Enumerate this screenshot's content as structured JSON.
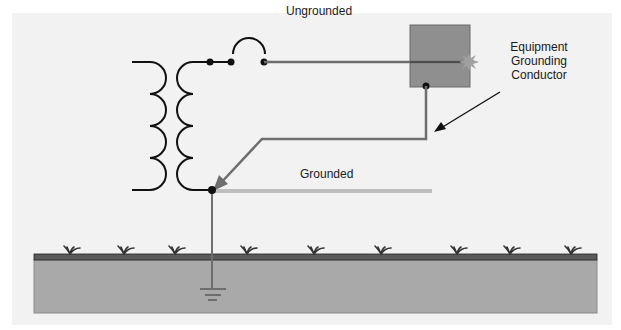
{
  "diagram": {
    "labels": {
      "ungrounded": "Ungrounded",
      "grounded": "Grounded",
      "egc_line1": "Equipment",
      "egc_line2": "Grounding",
      "egc_line3": "Conductor"
    },
    "components": [
      {
        "name": "transformer",
        "icon": "transformer-coils"
      },
      {
        "name": "overcurrent-device",
        "icon": "breaker-arc"
      },
      {
        "name": "equipment-enclosure",
        "icon": "metal-box"
      },
      {
        "name": "fault-spark",
        "icon": "spark-burst"
      },
      {
        "name": "grounding-electrode",
        "icon": "earth-ground-symbol"
      },
      {
        "name": "earth",
        "icon": "soil-with-grass"
      }
    ],
    "colors": {
      "background": "#f2f2f2",
      "conductor_dark": "#111111",
      "conductor_gray": "#6e6e6e",
      "enclosure_fill": "#8f8f8f",
      "enclosure_stroke": "#6a6a6a",
      "ground_surface": "#555555",
      "soil": "#a9a9a9",
      "spark": "#9c9c9c"
    }
  }
}
